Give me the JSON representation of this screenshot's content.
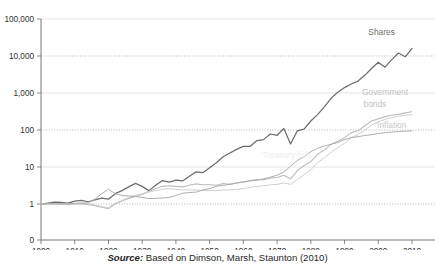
{
  "caption": {
    "source_word": "Source:",
    "text": " Based on Dimson, Marsh, Staunton (2010)"
  },
  "colors": {
    "shares": "#6d6d6d",
    "government_bonds": "#bcbcbc",
    "treasury_bills": "#cfcfcf",
    "inflation": "#a9a9a9",
    "axis": "#6a6a6a",
    "gridline": "#d8d8d8",
    "background": "#ffffff"
  },
  "labels": {
    "shares": "Shares",
    "government_bonds_line1": "Government",
    "government_bonds_line2": "bonds",
    "inflation": "Inflation",
    "treasury_bills": "Treasury bills"
  },
  "chart_data": {
    "type": "line",
    "title": "",
    "subtitle": "",
    "xlabel": "",
    "ylabel": "",
    "yscale": "log",
    "grid": true,
    "legend": "inline-right",
    "xlim": [
      1900,
      2010
    ],
    "ylim": [
      1,
      100000
    ],
    "ytick_labels": [
      "100,000",
      "10,000",
      "1,000",
      "100",
      "10",
      "1",
      "0"
    ],
    "ytick_values": [
      100000,
      10000,
      1000,
      100,
      10,
      1,
      0
    ],
    "xtick_labels": [
      "1900",
      "1910",
      "1920",
      "1930",
      "1940",
      "1950",
      "1960",
      "1970",
      "1980",
      "1990",
      "2000",
      "2010"
    ],
    "xtick_values": [
      1900,
      1910,
      1920,
      1930,
      1940,
      1950,
      1960,
      1970,
      1980,
      1990,
      2000,
      2010
    ],
    "x": [
      1900,
      1902,
      1904,
      1906,
      1908,
      1910,
      1912,
      1914,
      1916,
      1918,
      1920,
      1922,
      1924,
      1926,
      1928,
      1930,
      1932,
      1934,
      1936,
      1938,
      1940,
      1942,
      1944,
      1946,
      1948,
      1950,
      1952,
      1954,
      1956,
      1958,
      1960,
      1962,
      1964,
      1966,
      1968,
      1970,
      1972,
      1974,
      1976,
      1978,
      1980,
      1982,
      1984,
      1986,
      1988,
      1990,
      1992,
      1994,
      1996,
      1998,
      2000,
      2002,
      2004,
      2006,
      2008,
      2010
    ],
    "series": [
      {
        "name": "Shares",
        "color": "#6d6d6d",
        "end_value": 16000,
        "values": [
          1,
          1.05,
          1.12,
          1.1,
          1.05,
          1.2,
          1.25,
          1.15,
          1.3,
          1.45,
          1.35,
          1.9,
          2.3,
          2.9,
          3.6,
          3.0,
          2.3,
          3.2,
          4.3,
          3.9,
          4.4,
          4.2,
          5.6,
          7.4,
          7.0,
          9.5,
          13,
          19,
          24,
          30,
          36,
          36,
          52,
          55,
          78,
          72,
          110,
          42,
          95,
          105,
          175,
          260,
          420,
          720,
          1050,
          1400,
          1750,
          2100,
          3000,
          4600,
          6800,
          5000,
          8000,
          12000,
          9500,
          16000
        ]
      },
      {
        "name": "Government bonds",
        "color": "#bcbcbc",
        "end_value": 310,
        "values": [
          1,
          1.0,
          1.0,
          0.98,
          0.97,
          1.0,
          1.0,
          0.95,
          0.9,
          0.82,
          0.75,
          1.0,
          1.2,
          1.4,
          1.6,
          1.8,
          2.2,
          2.6,
          3.0,
          3.1,
          3.0,
          2.9,
          3.2,
          3.5,
          3.3,
          3.3,
          3.2,
          3.6,
          3.4,
          3.7,
          4.0,
          4.3,
          4.6,
          4.5,
          5.0,
          5.2,
          6.0,
          4.8,
          8.0,
          11,
          14,
          22,
          29,
          41,
          50,
          62,
          85,
          95,
          130,
          175,
          200,
          230,
          250,
          265,
          290,
          310
        ]
      },
      {
        "name": "Treasury bills",
        "color": "#cfcfcf",
        "end_value": 260,
        "values": [
          1,
          1.0,
          1.02,
          1.03,
          1.02,
          1.04,
          1.05,
          1.02,
          0.95,
          0.85,
          0.8,
          1.05,
          1.25,
          1.5,
          1.7,
          1.9,
          2.1,
          2.3,
          2.5,
          2.6,
          2.5,
          2.4,
          2.4,
          2.4,
          2.3,
          2.3,
          2.3,
          2.4,
          2.4,
          2.5,
          2.6,
          2.8,
          3.0,
          3.1,
          3.3,
          3.4,
          3.7,
          3.4,
          4.6,
          6.2,
          8.5,
          13,
          18,
          25,
          33,
          44,
          62,
          75,
          100,
          135,
          165,
          195,
          215,
          235,
          250,
          260
        ]
      },
      {
        "name": "Inflation",
        "color": "#a9a9a9",
        "end_value": 95,
        "values": [
          1,
          1.0,
          1.01,
          1.02,
          1.01,
          1.03,
          1.06,
          1.08,
          1.35,
          1.9,
          2.5,
          1.9,
          1.7,
          1.65,
          1.6,
          1.5,
          1.4,
          1.42,
          1.45,
          1.5,
          1.7,
          1.95,
          2.05,
          2.1,
          2.4,
          2.6,
          3.0,
          3.2,
          3.4,
          3.7,
          3.9,
          4.2,
          4.4,
          4.8,
          5.3,
          6.0,
          7.3,
          10.5,
          15,
          19,
          26,
          32,
          37,
          41,
          46,
          55,
          62,
          66,
          71,
          75,
          80,
          85,
          88,
          91,
          93,
          95
        ]
      }
    ],
    "annotations": [
      {
        "label": "Shares",
        "x": 2001,
        "y": 38000
      },
      {
        "label": "Government bonds",
        "x": 2003,
        "y": 620
      },
      {
        "label": "Inflation",
        "x": 2004,
        "y": 105
      },
      {
        "label": "Treasury bills",
        "x": 1972,
        "y": 17
      }
    ]
  }
}
